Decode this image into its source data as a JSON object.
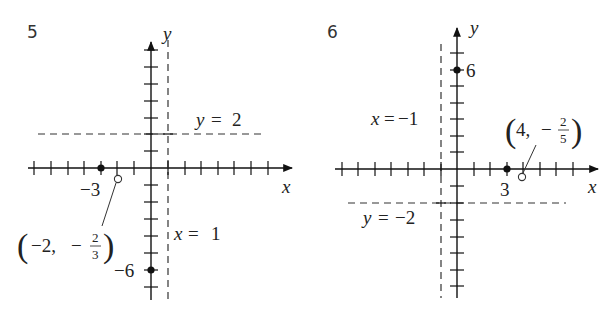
{
  "graphs": [
    {
      "number": "5",
      "axis_labels": {
        "x": "x",
        "y": "y"
      },
      "asymptotes": {
        "vertical": {
          "label_var": "x",
          "label_eq": "=",
          "label_val": "1",
          "value": 1
        },
        "horizontal": {
          "label_var": "y",
          "label_eq": "=",
          "label_val": "2",
          "value": 2
        }
      },
      "points": {
        "x_intercept": {
          "label": "−3",
          "x": -3,
          "y": 0,
          "type": "closed"
        },
        "y_intercept": {
          "label": "−6",
          "x": 0,
          "y": -6,
          "type": "closed"
        },
        "hole": {
          "label_open": "(",
          "label_x": "−2,",
          "label_minus": "−",
          "label_num": "2",
          "label_den": "3",
          "label_close": ")",
          "x": -2,
          "y": "-2/3",
          "type": "open"
        }
      }
    },
    {
      "number": "6",
      "axis_labels": {
        "x": "x",
        "y": "y"
      },
      "asymptotes": {
        "vertical": {
          "label_var": "x",
          "label_eq": "=",
          "label_val": "−1",
          "value": -1
        },
        "horizontal": {
          "label_var": "y",
          "label_eq": "=",
          "label_val": "−2",
          "value": -2
        }
      },
      "points": {
        "x_intercept": {
          "label": "3",
          "x": 3,
          "y": 0,
          "type": "closed"
        },
        "y_intercept": {
          "label": "6",
          "x": 0,
          "y": 6,
          "type": "closed"
        },
        "hole": {
          "label_open": "(",
          "label_x": "4,",
          "label_minus": "−",
          "label_num": "2",
          "label_den": "5",
          "label_close": ")",
          "x": 4,
          "y": "-2/5",
          "type": "open"
        }
      }
    }
  ]
}
